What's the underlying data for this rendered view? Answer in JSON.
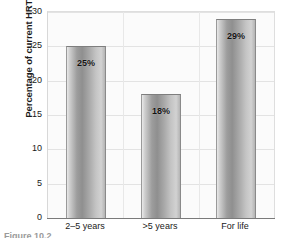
{
  "chart_data": {
    "type": "bar",
    "title": "",
    "xlabel": "",
    "ylabel": "Percentage of current HRT users",
    "categories": [
      "2–5 years",
      ">5 years",
      "For life"
    ],
    "values": [
      25,
      18,
      29
    ],
    "value_labels": [
      "25%",
      "18%",
      "29%"
    ],
    "ylim": [
      0,
      30
    ],
    "yticks": [
      0,
      5,
      10,
      15,
      20,
      25,
      30
    ],
    "ytick_labels": [
      "0",
      "5",
      "10",
      "15",
      "20",
      "25",
      "30"
    ],
    "grid": true,
    "grid_axis": "both",
    "legend": false,
    "legend_position": "none",
    "bar_style": "cylinder-gradient-grayscale",
    "colors": {
      "bar_light": "#e9e9e9",
      "bar_dark": "#8f8f8f",
      "bar_edge": "#7e7e7e",
      "plot_background": "#fbfbfb",
      "gridline": "#e3e3e3",
      "axis": "#7a7a7a",
      "text": "#1a1a1a",
      "caption": "#9a9a9a"
    }
  },
  "caption": {
    "text": "Figure 10.2"
  }
}
